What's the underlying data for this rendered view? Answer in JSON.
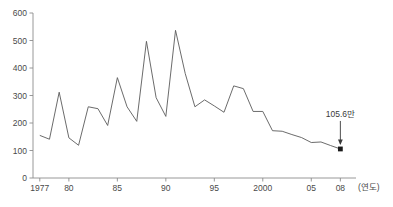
{
  "chart_data": {
    "type": "line",
    "title": "",
    "xlabel": "(연도)",
    "ylabel": "",
    "xlim": [
      1976.3,
      2009.2
    ],
    "ylim": [
      0,
      600
    ],
    "grid": false,
    "legend": null,
    "y_ticks": [
      0,
      100,
      200,
      300,
      400,
      500,
      600
    ],
    "y_tick_labels": [
      "0",
      "100",
      "200",
      "300",
      "400",
      "500",
      "600"
    ],
    "x_ticks": [
      1977,
      1980,
      1985,
      1990,
      1995,
      2000,
      2005,
      2008
    ],
    "x_tick_labels": [
      "1977",
      "80",
      "85",
      "90",
      "95",
      "2000",
      "05",
      "08"
    ],
    "x": [
      1977,
      1978,
      1979,
      1980,
      1981,
      1982,
      1983,
      1984,
      1985,
      1986,
      1987,
      1988,
      1989,
      1990,
      1991,
      1992,
      1993,
      1994,
      1995,
      1996,
      1997,
      1998,
      1999,
      2000,
      2001,
      2002,
      2003,
      2004,
      2005,
      2006,
      2007,
      2008
    ],
    "values": [
      155,
      141,
      312,
      146,
      119,
      259,
      252,
      191,
      365,
      259,
      206,
      497,
      292,
      224,
      537,
      380,
      259,
      284,
      262,
      239,
      335,
      325,
      242,
      242,
      172,
      170,
      158,
      147,
      129,
      131,
      118,
      105.6
    ],
    "series": [
      {
        "name": "",
        "values": [
          155,
          141,
          312,
          146,
          119,
          259,
          252,
          191,
          365,
          259,
          206,
          497,
          292,
          224,
          537,
          380,
          259,
          284,
          262,
          239,
          335,
          325,
          242,
          242,
          172,
          170,
          158,
          147,
          129,
          131,
          118,
          105.6
        ]
      }
    ],
    "annotations": [
      {
        "text": "105.6만",
        "x": 2008,
        "y": 105.6,
        "marker": "dot",
        "arrow": "down"
      }
    ],
    "colors": {
      "line": "#5a5a5a",
      "axis": "#8c8c8c",
      "text": "#3a3a3a",
      "marker": "#1a1a1a",
      "background": "#ffffff"
    }
  }
}
